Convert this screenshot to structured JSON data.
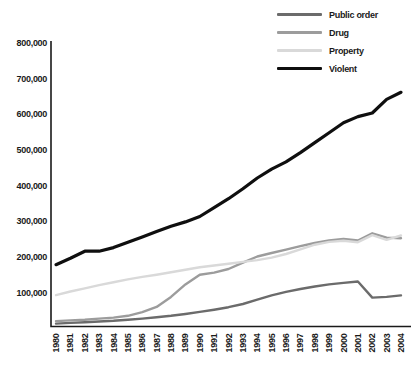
{
  "chart_data": {
    "type": "line",
    "title": "",
    "xlabel": "",
    "ylabel": "",
    "grid": false,
    "legend_position": "top-right",
    "ylim": [
      0,
      800000
    ],
    "x": [
      1980,
      1981,
      1982,
      1983,
      1984,
      1985,
      1986,
      1987,
      1988,
      1989,
      1990,
      1991,
      1992,
      1993,
      1994,
      1995,
      1996,
      1997,
      1998,
      1999,
      2000,
      2001,
      2002,
      2003,
      2004
    ],
    "x_tick_labels": [
      "1980",
      "1981",
      "1982",
      "1983",
      "1984",
      "1985",
      "1986",
      "1987",
      "1988",
      "1989",
      "1990",
      "1991",
      "1992",
      "1993",
      "1994",
      "1995",
      "1996",
      "1997",
      "1998",
      "1999",
      "2000",
      "2001",
      "2002",
      "2003",
      "2004"
    ],
    "y_ticks": [
      {
        "value": 800000,
        "label": "800,000"
      },
      {
        "value": 700000,
        "label": "700,000"
      },
      {
        "value": 600000,
        "label": "600,000"
      },
      {
        "value": 500000,
        "label": "500,000"
      },
      {
        "value": 400000,
        "label": "400,000"
      },
      {
        "value": 300000,
        "label": "300,000"
      },
      {
        "value": 200000,
        "label": "200,000"
      },
      {
        "value": 100000,
        "label": "100,000"
      }
    ],
    "series": [
      {
        "name": "Public order",
        "color": "#6b6b6b",
        "stroke_width": 2.4,
        "values": [
          15000,
          17000,
          19000,
          21000,
          23000,
          26000,
          29000,
          33000,
          37000,
          42000,
          48000,
          54000,
          61000,
          70000,
          82000,
          94000,
          104000,
          112000,
          119000,
          125000,
          129000,
          133000,
          88000,
          90000,
          94000
        ]
      },
      {
        "name": "Drug",
        "color": "#9c9c9c",
        "stroke_width": 2.4,
        "values": [
          22000,
          24000,
          26000,
          29000,
          32000,
          37000,
          47000,
          62000,
          90000,
          125000,
          152000,
          158000,
          168000,
          186000,
          203000,
          213000,
          222000,
          232000,
          241000,
          248000,
          252000,
          248000,
          268000,
          256000,
          254000
        ]
      },
      {
        "name": "Property",
        "color": "#d9d9d9",
        "stroke_width": 2.4,
        "values": [
          95000,
          105000,
          114000,
          123000,
          131000,
          139000,
          146000,
          152000,
          159000,
          166000,
          173000,
          178000,
          183000,
          188000,
          193000,
          200000,
          210000,
          223000,
          236000,
          244000,
          247000,
          243000,
          263000,
          250000,
          262000
        ]
      },
      {
        "name": "Violent",
        "color": "#0f0f0f",
        "stroke_width": 3.2,
        "values": [
          180000,
          198000,
          218000,
          218000,
          228000,
          243000,
          258000,
          273000,
          288000,
          300000,
          315000,
          340000,
          365000,
          393000,
          423000,
          448000,
          468000,
          494000,
          522000,
          550000,
          578000,
          595000,
          605000,
          643000,
          663000
        ]
      }
    ]
  }
}
